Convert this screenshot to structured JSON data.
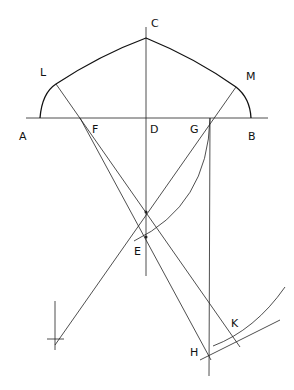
{
  "diagram": {
    "type": "geometric-construction",
    "labels": {
      "A": "A",
      "B": "B",
      "C": "C",
      "D": "D",
      "E": "E",
      "F": "F",
      "G": "G",
      "H": "H",
      "K": "K",
      "L": "L",
      "M": "M"
    },
    "stroke_color": "#222222"
  }
}
